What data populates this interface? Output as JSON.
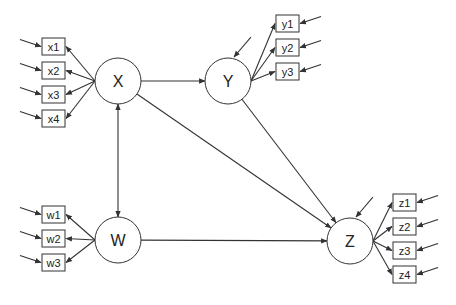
{
  "diagram": {
    "type": "structural-equation-model",
    "line_color": "#333333",
    "latent": [
      {
        "id": "X",
        "label": "X",
        "cx": 118,
        "cy": 81
      },
      {
        "id": "Y",
        "label": "Y",
        "cx": 228,
        "cy": 81
      },
      {
        "id": "W",
        "label": "W",
        "cx": 118,
        "cy": 240
      },
      {
        "id": "Z",
        "label": "Z",
        "cx": 350,
        "cy": 241
      }
    ],
    "observed": [
      {
        "id": "x1",
        "label": "x1",
        "parent": "X",
        "side": "left",
        "x": 42,
        "y": 38
      },
      {
        "id": "x2",
        "label": "x2",
        "parent": "X",
        "side": "left",
        "x": 42,
        "y": 62
      },
      {
        "id": "x3",
        "label": "x3",
        "parent": "X",
        "side": "left",
        "x": 42,
        "y": 86
      },
      {
        "id": "x4",
        "label": "x4",
        "parent": "X",
        "side": "left",
        "x": 42,
        "y": 110
      },
      {
        "id": "y1",
        "label": "y1",
        "parent": "Y",
        "side": "right",
        "x": 276,
        "y": 15
      },
      {
        "id": "y2",
        "label": "y2",
        "parent": "Y",
        "side": "right",
        "x": 276,
        "y": 39
      },
      {
        "id": "y3",
        "label": "y3",
        "parent": "Y",
        "side": "right",
        "x": 276,
        "y": 63
      },
      {
        "id": "w1",
        "label": "w1",
        "parent": "W",
        "side": "left",
        "x": 42,
        "y": 206
      },
      {
        "id": "w2",
        "label": "w2",
        "parent": "W",
        "side": "left",
        "x": 42,
        "y": 230
      },
      {
        "id": "w3",
        "label": "w3",
        "parent": "W",
        "side": "left",
        "x": 42,
        "y": 254
      },
      {
        "id": "z1",
        "label": "z1",
        "parent": "Z",
        "side": "right",
        "x": 393,
        "y": 194
      },
      {
        "id": "z2",
        "label": "z2",
        "parent": "Z",
        "side": "right",
        "x": 393,
        "y": 218
      },
      {
        "id": "z3",
        "label": "z3",
        "parent": "Z",
        "side": "right",
        "x": 393,
        "y": 242
      },
      {
        "id": "z4",
        "label": "z4",
        "parent": "Z",
        "side": "right",
        "x": 393,
        "y": 266
      }
    ],
    "paths": [
      {
        "from": "X",
        "to": "Y",
        "type": "directed"
      },
      {
        "from": "X",
        "to": "Z",
        "type": "directed"
      },
      {
        "from": "Y",
        "to": "Z",
        "type": "directed"
      },
      {
        "from": "W",
        "to": "Z",
        "type": "directed"
      },
      {
        "from": "X",
        "to": "W",
        "type": "covariance"
      }
    ],
    "disturbances": [
      "Y",
      "Z"
    ]
  }
}
